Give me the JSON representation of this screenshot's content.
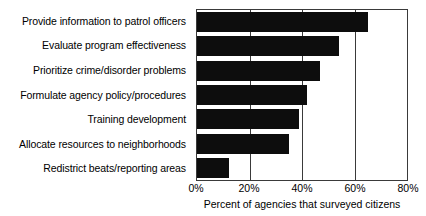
{
  "chart_data": {
    "type": "bar",
    "orientation": "horizontal",
    "title": "",
    "xlabel": "Percent of agencies that surveyed citizens",
    "ylabel": "",
    "xlim": [
      0,
      80
    ],
    "xticks": [
      0,
      20,
      40,
      60,
      80
    ],
    "xtick_labels": [
      "0%",
      "20%",
      "40%",
      "60%",
      "80%"
    ],
    "grid": "vertical",
    "legend": "none",
    "bar_color": "#0d0d0d",
    "categories": [
      "Provide information to patrol officers",
      "Evaluate program effectiveness",
      "Prioritize crime/disorder problems",
      "Formulate agency policy/procedures",
      "Training development",
      "Allocate resources to neighborhoods",
      "Redistrict beats/reporting areas"
    ],
    "values": [
      65,
      54,
      47,
      42,
      39,
      35,
      12
    ],
    "value_labels": [
      "65%",
      "54%",
      "47%",
      "42%",
      "39%",
      "35%",
      "12%"
    ]
  }
}
